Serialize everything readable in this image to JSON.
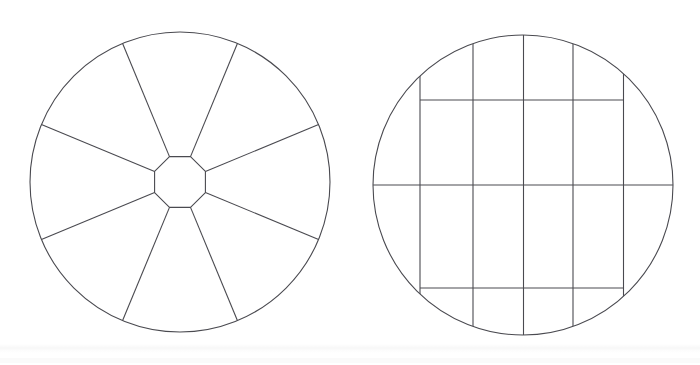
{
  "page": {
    "width": 700,
    "height": 365,
    "background_color": "#ffffff",
    "line_color": "#4a4a50",
    "line_width": 1.1
  },
  "figures": [
    {
      "id": "radial-wheel",
      "name": "Radial spoke wheel with octagonal hub",
      "type": "radial-segmented-circle",
      "outer_circle": {
        "cx": 180,
        "cy": 182,
        "r": 150
      },
      "hub": {
        "shape": "octagon",
        "cx": 180,
        "cy": 182,
        "circumradius": 27.5,
        "rotation_deg": 22.5,
        "vertex_count": 8
      },
      "spoke_count": 8,
      "spoke_angles_deg": [
        22.5,
        67.5,
        112.5,
        157.5,
        202.5,
        247.5,
        292.5,
        337.5
      ],
      "sector_count": 8
    },
    {
      "id": "orthogonal-grid-circle",
      "name": "Circle overlaid with orthogonal grid",
      "type": "grid-clipped-circle",
      "outer_circle": {
        "cx": 523,
        "cy": 185,
        "r": 150
      },
      "vertical_lines_x": [
        420,
        473,
        523.5,
        573,
        623.5
      ],
      "horizontal_lines": [
        {
          "y": 100,
          "x1": 420,
          "x2": 623.5,
          "span": "between-outer-verticals"
        },
        {
          "y": 185,
          "x1": 373,
          "x2": 674,
          "span": "full-diameter"
        },
        {
          "y": 288,
          "x1": 420,
          "x2": 623.5,
          "span": "between-outer-verticals"
        }
      ],
      "vertical_clip": "circle",
      "cell_columns": 6,
      "cell_rows": 4
    }
  ],
  "artifacts": {
    "scan_band_top_y": 344,
    "scan_band_lower_y": 358,
    "description": "faint horizontal scan shading near page bottom"
  }
}
